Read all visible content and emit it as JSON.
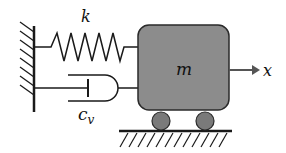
{
  "diagram": {
    "labels": {
      "spring": "k",
      "damper_main": "c",
      "damper_sub": "v",
      "mass": "m",
      "displacement": "x"
    },
    "colors": {
      "line": "#1a1a1a",
      "mass_fill": "#8c8c8c",
      "mass_stroke": "#2a2a2a",
      "wheel_fill": "#7a7a7a",
      "background": "#ffffff"
    },
    "components": [
      "fixed-wall",
      "spring",
      "damper",
      "mass",
      "wheels",
      "ground",
      "displacement-arrow"
    ]
  }
}
